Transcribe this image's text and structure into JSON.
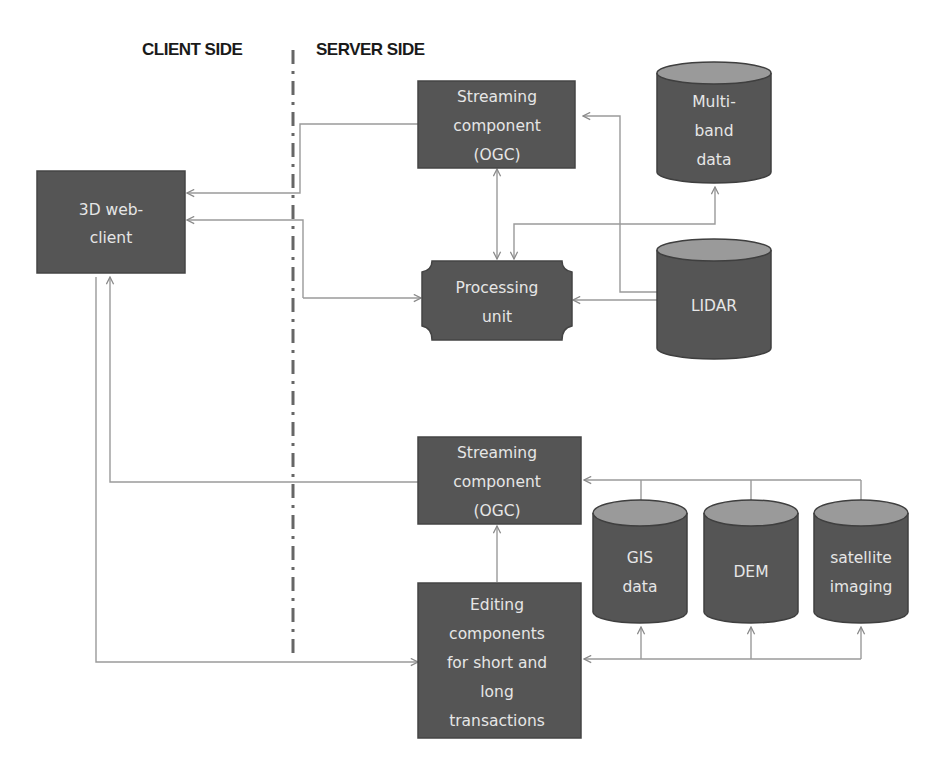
{
  "diagram": {
    "side_labels": {
      "client": "CLIENT SIDE",
      "server": "SERVER SIDE"
    },
    "nodes": {
      "web_client": {
        "lines": [
          "3D web-",
          "client"
        ],
        "shape": "rectangle"
      },
      "streaming_top": {
        "lines": [
          "Streaming",
          "component",
          "(OGC)"
        ],
        "shape": "rectangle"
      },
      "processing": {
        "lines": [
          "Processing",
          "unit"
        ],
        "shape": "plaque"
      },
      "multiband": {
        "lines": [
          "Multi-",
          "band",
          "data"
        ],
        "shape": "cylinder"
      },
      "lidar": {
        "lines": [
          "LIDAR"
        ],
        "shape": "cylinder"
      },
      "streaming_bottom": {
        "lines": [
          "Streaming",
          "component",
          "(OGC)"
        ],
        "shape": "rectangle"
      },
      "editing": {
        "lines": [
          "Editing",
          "components",
          "for short and",
          "long",
          "transactions"
        ],
        "shape": "rectangle"
      },
      "gis": {
        "lines": [
          "GIS",
          "data"
        ],
        "shape": "cylinder"
      },
      "dem": {
        "lines": [
          "DEM"
        ],
        "shape": "cylinder"
      },
      "satellite": {
        "lines": [
          "satellite",
          "imaging"
        ],
        "shape": "cylinder"
      }
    },
    "edges": [
      {
        "from": "streaming_top",
        "to": "web_client",
        "arrow": "end"
      },
      {
        "from": "processing",
        "to": "web_client",
        "arrow": "end"
      },
      {
        "from": "web_client",
        "to": "processing",
        "arrow": "end"
      },
      {
        "from": "streaming_top",
        "to": "processing",
        "arrow": "both"
      },
      {
        "from": "multiband",
        "to": "processing",
        "arrow": "both"
      },
      {
        "from": "lidar",
        "to": "streaming_top",
        "arrow": "both"
      },
      {
        "from": "processing",
        "to": "lidar",
        "arrow": "both"
      },
      {
        "from": "streaming_bottom",
        "to": "web_client",
        "arrow": "end"
      },
      {
        "from": "editing",
        "to": "streaming_bottom",
        "arrow": "end"
      },
      {
        "from": "web_client",
        "to": "editing",
        "arrow": "end"
      },
      {
        "from": "gis",
        "to": "streaming_bottom",
        "arrow": "end"
      },
      {
        "from": "dem",
        "to": "streaming_bottom",
        "arrow": "end"
      },
      {
        "from": "satellite",
        "to": "streaming_bottom",
        "arrow": "end"
      },
      {
        "from": "editing",
        "to": "gis",
        "arrow": "end"
      },
      {
        "from": "editing",
        "to": "dem",
        "arrow": "end"
      },
      {
        "from": "editing",
        "to": "satellite",
        "arrow": "end"
      }
    ],
    "colors": {
      "node_fill": "#555555",
      "cylinder_top": "#9a9a9a",
      "node_text": "#e6e6e6",
      "edge": "#9a9a9a",
      "divider": "#666666"
    }
  }
}
